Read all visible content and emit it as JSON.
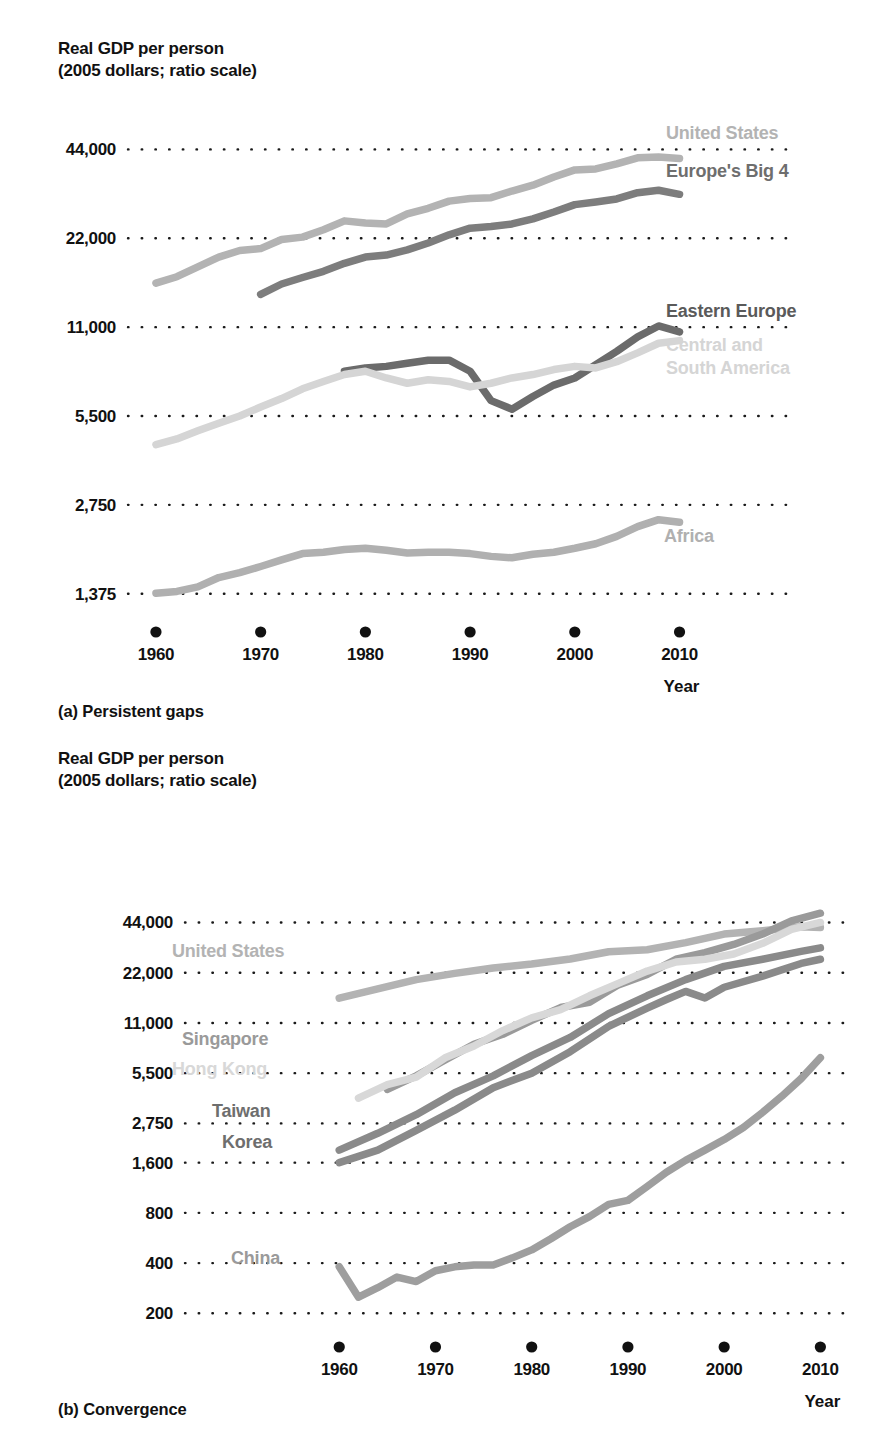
{
  "panel_a": {
    "axis_title": "Real GDP per person\n(2005 dollars; ratio scale)",
    "caption": "(a) Persistent gaps",
    "xlabel": "Year",
    "yticks": [
      "44,000",
      "22,000",
      "11,000",
      "5,500",
      "2,750",
      "1,375"
    ],
    "xticks": [
      "1960",
      "1970",
      "1980",
      "1990",
      "2000",
      "2010"
    ],
    "labels": {
      "united_states": "United States",
      "europes_big_4": "Europe's Big 4",
      "eastern_europe": "Eastern Europe",
      "central_south_america_l1": "Central and",
      "central_south_america_l2": "South America",
      "africa": "Africa"
    }
  },
  "panel_b": {
    "axis_title": "Real GDP per person\n(2005 dollars; ratio scale)",
    "caption": "(b) Convergence",
    "xlabel": "Year",
    "yticks": [
      "44,000",
      "22,000",
      "11,000",
      "5,500",
      "2,750",
      "1,600",
      "800",
      "400",
      "200"
    ],
    "xticks": [
      "1960",
      "1970",
      "1980",
      "1990",
      "2000",
      "2010"
    ],
    "labels": {
      "united_states": "United States",
      "singapore": "Singapore",
      "hong_kong": "Hong Kong",
      "taiwan": "Taiwan",
      "korea": "Korea",
      "china": "China"
    }
  },
  "colors": {
    "very_light_gray": "#d5d5d5",
    "light_gray": "#b3b3b3",
    "medium_gray": "#999999",
    "dark_gray": "#6e6e6e",
    "darker_gray": "#5a5a5a",
    "text_black": "#111111",
    "gridline": "#1a1a1a"
  },
  "chart_data": [
    {
      "type": "line",
      "title": "Real GDP per person (2005 dollars; ratio scale)",
      "subtitle": "(a) Persistent gaps",
      "xlabel": "Year",
      "ylabel": "Real GDP per person (2005 dollars)",
      "scale": "log",
      "grid": true,
      "legend": "inline-right",
      "xlim": [
        1958,
        2011
      ],
      "ylim": [
        1230,
        52000
      ],
      "yticks": [
        1375,
        2750,
        5500,
        11000,
        22000,
        44000
      ],
      "xticks": [
        1960,
        1970,
        1980,
        1990,
        2000,
        2010
      ],
      "series": [
        {
          "name": "United States",
          "color": "#b3b3b3",
          "x": [
            1960,
            1962,
            1964,
            1966,
            1968,
            1970,
            1972,
            1974,
            1976,
            1978,
            1980,
            1982,
            1984,
            1986,
            1988,
            1990,
            1992,
            1994,
            1996,
            1998,
            2000,
            2002,
            2004,
            2006,
            2008,
            2010
          ],
          "values": [
            15500,
            16300,
            17600,
            19000,
            20000,
            20300,
            21800,
            22200,
            23500,
            25200,
            24800,
            24600,
            26600,
            27800,
            29400,
            30000,
            30200,
            31800,
            33300,
            35500,
            37500,
            37800,
            39300,
            41200,
            41500,
            41000
          ]
        },
        {
          "name": "Europe's Big 4",
          "color": "#7d7d7d",
          "x": [
            1970,
            1972,
            1974,
            1976,
            1978,
            1980,
            1982,
            1984,
            1986,
            1988,
            1990,
            1992,
            1994,
            1996,
            1998,
            2000,
            2002,
            2004,
            2006,
            2008,
            2010
          ],
          "values": [
            14200,
            15400,
            16200,
            17000,
            18100,
            19000,
            19300,
            20100,
            21200,
            22600,
            23800,
            24100,
            24600,
            25600,
            27000,
            28600,
            29200,
            29900,
            31400,
            32000,
            31000
          ]
        },
        {
          "name": "Eastern Europe",
          "color": "#6b6b6b",
          "x": [
            1978,
            1980,
            1982,
            1984,
            1986,
            1988,
            1990,
            1992,
            1994,
            1996,
            1998,
            2000,
            2002,
            2004,
            2006,
            2008,
            2010
          ],
          "values": [
            7800,
            8000,
            8100,
            8300,
            8500,
            8500,
            7800,
            6200,
            5800,
            6400,
            7000,
            7400,
            8200,
            9100,
            10200,
            11100,
            10600
          ]
        },
        {
          "name": "Central and South America",
          "color": "#d5d5d5",
          "x": [
            1960,
            1962,
            1964,
            1966,
            1968,
            1970,
            1972,
            1974,
            1976,
            1978,
            1980,
            1982,
            1984,
            1986,
            1988,
            1990,
            1992,
            1994,
            1996,
            1998,
            2000,
            2002,
            2004,
            2006,
            2008,
            2010
          ],
          "values": [
            4400,
            4600,
            4900,
            5200,
            5500,
            5900,
            6300,
            6800,
            7200,
            7600,
            7800,
            7400,
            7100,
            7300,
            7200,
            6900,
            7100,
            7400,
            7600,
            7900,
            8100,
            8000,
            8400,
            9000,
            9700,
            9900
          ]
        },
        {
          "name": "Africa",
          "color": "#b0b0b0",
          "x": [
            1960,
            1962,
            1964,
            1966,
            1968,
            1970,
            1972,
            1974,
            1976,
            1978,
            1980,
            1982,
            1984,
            1986,
            1988,
            1990,
            1992,
            1994,
            1996,
            1998,
            2000,
            2002,
            2004,
            2006,
            2008,
            2010
          ],
          "values": [
            1380,
            1400,
            1450,
            1560,
            1620,
            1700,
            1790,
            1880,
            1900,
            1940,
            1960,
            1930,
            1890,
            1900,
            1900,
            1880,
            1840,
            1820,
            1870,
            1900,
            1960,
            2030,
            2150,
            2320,
            2450,
            2400
          ]
        }
      ]
    },
    {
      "type": "line",
      "title": "Real GDP per person (2005 dollars; ratio scale)",
      "subtitle": "(b) Convergence",
      "xlabel": "Year",
      "ylabel": "Real GDP per person (2005 dollars)",
      "scale": "log",
      "grid": true,
      "legend": "inline-left",
      "xlim": [
        1958,
        2011
      ],
      "ylim": [
        175,
        56000
      ],
      "yticks": [
        200,
        400,
        800,
        1600,
        2750,
        5500,
        11000,
        22000,
        44000
      ],
      "xticks": [
        1960,
        1970,
        1980,
        1990,
        2000,
        2010
      ],
      "series": [
        {
          "name": "United States",
          "color": "#b3b3b3",
          "x": [
            1960,
            1964,
            1968,
            1972,
            1976,
            1980,
            1984,
            1988,
            1992,
            1996,
            2000,
            2004,
            2008,
            2010
          ],
          "values": [
            15500,
            17600,
            20000,
            21800,
            23500,
            24800,
            26600,
            29400,
            30200,
            33300,
            37500,
            39300,
            41500,
            41000
          ]
        },
        {
          "name": "Singapore",
          "color": "#9a9a9a",
          "x": [
            1965,
            1968,
            1971,
            1974,
            1977,
            1980,
            1983,
            1986,
            1989,
            1992,
            1995,
            1998,
            2001,
            2004,
            2007,
            2010
          ],
          "values": [
            4400,
            5300,
            6600,
            8200,
            9400,
            11400,
            13600,
            14600,
            18600,
            21500,
            26500,
            29000,
            32500,
            37500,
            45000,
            50000
          ]
        },
        {
          "name": "Hong Kong",
          "color": "#d8d8d8",
          "x": [
            1962,
            1965,
            1968,
            1971,
            1974,
            1977,
            1980,
            1983,
            1986,
            1989,
            1992,
            1995,
            1998,
            2001,
            2004,
            2007,
            2010
          ],
          "values": [
            3900,
            4700,
            5200,
            6800,
            8000,
            9900,
            11800,
            13200,
            16000,
            19000,
            22500,
            25500,
            26500,
            28500,
            33000,
            40000,
            44000
          ]
        },
        {
          "name": "Taiwan",
          "color": "#8a8a8a",
          "x": [
            1960,
            1964,
            1968,
            1972,
            1976,
            1980,
            1984,
            1988,
            1992,
            1996,
            2000,
            2004,
            2008,
            2010
          ],
          "values": [
            1900,
            2400,
            3100,
            4200,
            5300,
            7000,
            9000,
            12500,
            16000,
            20000,
            24000,
            26500,
            29500,
            31000
          ]
        },
        {
          "name": "Korea",
          "color": "#8a8a8a",
          "x": [
            1960,
            1964,
            1968,
            1972,
            1976,
            1980,
            1984,
            1988,
            1992,
            1994,
            1996,
            1998,
            2000,
            2004,
            2008,
            2010
          ],
          "values": [
            1600,
            1900,
            2500,
            3300,
            4500,
            5500,
            7400,
            10500,
            13500,
            15200,
            17000,
            15500,
            18000,
            21000,
            25000,
            26500
          ]
        },
        {
          "name": "China",
          "color": "#9e9e9e",
          "x": [
            1960,
            1962,
            1964,
            1966,
            1968,
            1970,
            1972,
            1974,
            1976,
            1978,
            1980,
            1982,
            1984,
            1986,
            1988,
            1990,
            1992,
            1994,
            1996,
            1998,
            2000,
            2002,
            2004,
            2006,
            2008,
            2010
          ],
          "values": [
            380,
            250,
            285,
            330,
            310,
            360,
            380,
            390,
            390,
            430,
            480,
            560,
            660,
            760,
            900,
            950,
            1150,
            1400,
            1650,
            1900,
            2200,
            2600,
            3200,
            4000,
            5100,
            6800
          ]
        }
      ]
    }
  ]
}
